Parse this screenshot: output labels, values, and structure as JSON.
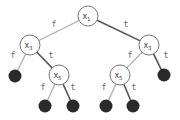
{
  "diagram": {
    "type": "binary-decision-tree",
    "colors": {
      "false_edge": "#b0b0b0",
      "true_edge": "#555555",
      "node_stroke": "#777777",
      "leaf_fill": "#2a2a2a"
    },
    "nodes": [
      {
        "id": "n1",
        "var": "x",
        "sub": "1",
        "cx": 88,
        "cy": 16
      },
      {
        "id": "n2",
        "var": "x",
        "sub": "3",
        "cx": 30,
        "cy": 45
      },
      {
        "id": "n3",
        "var": "x",
        "sub": "3",
        "cx": 149,
        "cy": 45
      },
      {
        "id": "n4",
        "var": "x",
        "sub": "5",
        "cx": 59,
        "cy": 75
      },
      {
        "id": "n5",
        "var": "x",
        "sub": "5",
        "cx": 120,
        "cy": 75
      }
    ],
    "leaves": [
      {
        "id": "l1",
        "cx": 15,
        "cy": 76
      },
      {
        "id": "l2",
        "cx": 45,
        "cy": 106
      },
      {
        "id": "l3",
        "cx": 73,
        "cy": 106
      },
      {
        "id": "l4",
        "cx": 106,
        "cy": 106
      },
      {
        "id": "l5",
        "cx": 133,
        "cy": 106
      },
      {
        "id": "l6",
        "cx": 164,
        "cy": 75
      }
    ],
    "edges": [
      {
        "from": "n1",
        "to": "n2",
        "label": "f",
        "lx": 54,
        "ly": 27
      },
      {
        "from": "n1",
        "to": "n3",
        "label": "t",
        "lx": 126,
        "ly": 27
      },
      {
        "from": "n2",
        "to": "l1",
        "label": "f",
        "lx": 13,
        "ly": 58
      },
      {
        "from": "n2",
        "to": "n4",
        "label": "t",
        "lx": 51,
        "ly": 58
      },
      {
        "from": "n4",
        "to": "l2",
        "label": "f",
        "lx": 43,
        "ly": 90
      },
      {
        "from": "n4",
        "to": "l3",
        "label": "t",
        "lx": 73,
        "ly": 90
      },
      {
        "from": "n3",
        "to": "n5",
        "label": "f",
        "lx": 130,
        "ly": 58
      },
      {
        "from": "n3",
        "to": "l6",
        "label": "t",
        "lx": 166,
        "ly": 58
      },
      {
        "from": "n5",
        "to": "l4",
        "label": "f",
        "lx": 104,
        "ly": 90
      },
      {
        "from": "n5",
        "to": "l5",
        "label": "t",
        "lx": 134,
        "ly": 90
      }
    ]
  }
}
